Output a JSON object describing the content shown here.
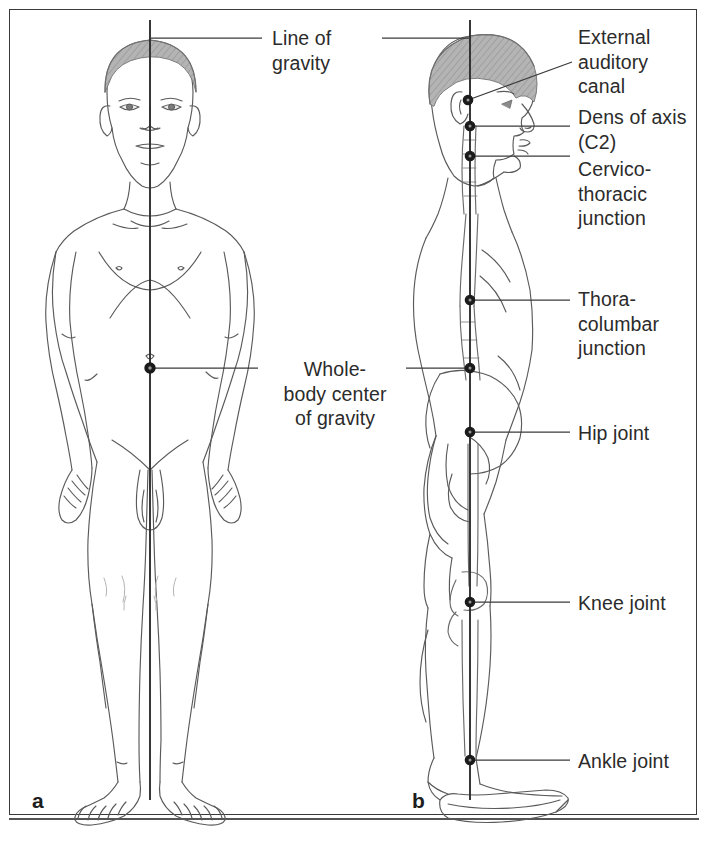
{
  "figure": {
    "frame_color": "#3a3a3a",
    "background": "#ffffff",
    "ink_color": "#4a4a4a",
    "hair_color": "#a8a8a8",
    "text_color": "#2b2b2b"
  },
  "panels": [
    {
      "letter": "a",
      "view": "anterior",
      "x": 88,
      "y": 800
    },
    {
      "letter": "b",
      "view": "lateral",
      "x": 412,
      "y": 800
    }
  ],
  "labels": {
    "line_of_gravity": "Line of\ngravity",
    "whole_body_center": "Whole-\nbody center\nof gravity",
    "external_auditory_canal": "External\nauditory\ncanal",
    "dens_of_axis": "Dens of axis\n(C2)",
    "cervicothoracic_junction": "Cervico-\nthoracic\njunction",
    "thoracolumbar_junction": "Thora-\ncolumbar\njunction",
    "hip_joint": "Hip joint",
    "knee_joint": "Knee joint",
    "ankle_joint": "Ankle joint"
  },
  "landmarks": [
    {
      "name": "external-auditory-canal",
      "panel": "b",
      "x": 468,
      "y": 100,
      "label_key": "external_auditory_canal"
    },
    {
      "name": "dens-of-axis-c2",
      "panel": "b",
      "x": 470,
      "y": 126,
      "label_key": "dens_of_axis"
    },
    {
      "name": "cervicothoracic-junction",
      "panel": "b",
      "x": 470,
      "y": 156,
      "label_key": "cervicothoracic_junction"
    },
    {
      "name": "thoracolumbar-junction",
      "panel": "b",
      "x": 470,
      "y": 300,
      "label_key": "thoracolumbar_junction"
    },
    {
      "name": "whole-body-center-of-gravity-lateral",
      "panel": "b",
      "x": 470,
      "y": 368,
      "label_key": "whole_body_center"
    },
    {
      "name": "hip-joint",
      "panel": "b",
      "x": 470,
      "y": 432,
      "label_key": "hip_joint"
    },
    {
      "name": "knee-joint",
      "panel": "b",
      "x": 470,
      "y": 602,
      "label_key": "knee_joint"
    },
    {
      "name": "ankle-joint",
      "panel": "b",
      "x": 470,
      "y": 760,
      "label_key": "ankle_joint"
    },
    {
      "name": "whole-body-center-of-gravity-anterior",
      "panel": "a",
      "x": 150,
      "y": 368,
      "label_key": "whole_body_center"
    }
  ],
  "gravity_lines": [
    {
      "panel": "a",
      "x": 150,
      "y_top": 20,
      "y_bottom": 800
    },
    {
      "panel": "b",
      "x": 470,
      "y_top": 20,
      "y_bottom": 800
    }
  ],
  "label_positions": {
    "line_of_gravity": {
      "x": 272,
      "y": 26
    },
    "whole_body_center": {
      "x": 268,
      "y": 358
    },
    "external_auditory_canal": {
      "x": 578,
      "y": 26
    },
    "dens_of_axis": {
      "x": 578,
      "y": 106
    },
    "cervicothoracic_junction": {
      "x": 578,
      "y": 158
    },
    "thoracolumbar_junction": {
      "x": 578,
      "y": 285
    },
    "hip_joint": {
      "x": 578,
      "y": 422
    },
    "knee_joint": {
      "x": 578,
      "y": 592
    },
    "ankle_joint": {
      "x": 578,
      "y": 748
    }
  }
}
